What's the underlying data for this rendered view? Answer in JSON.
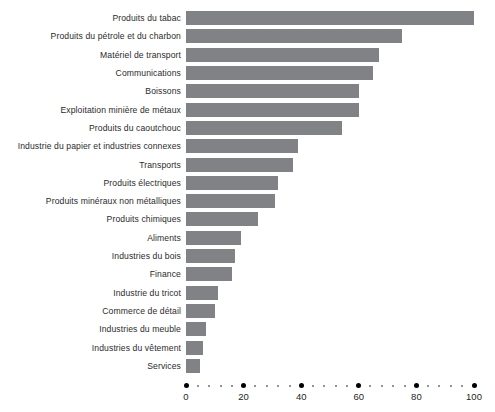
{
  "chart_data": {
    "type": "bar",
    "orientation": "horizontal",
    "title": "",
    "subtitle": "",
    "xlabel": "",
    "ylabel": "",
    "xlim": [
      0,
      100
    ],
    "grid": false,
    "legend": null,
    "bar_color": "#808285",
    "axis_color": "#000000",
    "minor_tick_color": "#6f6f6f",
    "background": "#ffffff",
    "x_major_ticks": [
      0,
      20,
      40,
      60,
      80,
      100
    ],
    "x_tick_labels": [
      "0",
      "20",
      "40",
      "60",
      "80",
      "100"
    ],
    "x_minor_tick_step": 4,
    "categories": [
      "Produits du tabac",
      "Produits du pétrole et du charbon",
      "Matériel de transport",
      "Communications",
      "Boissons",
      "Exploitation minière de métaux",
      "Produits du caoutchouc",
      "Industrie du papier et industries connexes",
      "Transports",
      "Produits électriques",
      "Produits minéraux non métalliques",
      "Produits chimiques",
      "Aliments",
      "Industries du bois",
      "Finance",
      "Industrie du tricot",
      "Commerce de détail",
      "Industries du meuble",
      "Industries du vêtement",
      "Services"
    ],
    "values": [
      100,
      75,
      67,
      65,
      60,
      60,
      54,
      39,
      37,
      32,
      31,
      25,
      19,
      17,
      16,
      11,
      10,
      7,
      6,
      5
    ]
  }
}
